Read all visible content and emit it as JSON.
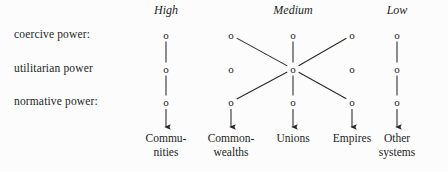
{
  "figure": {
    "background_color": "#fcfcfc",
    "ink_color": "#2a2724"
  },
  "column_headers": [
    {
      "label": "High",
      "x": 166
    },
    {
      "label": "Medium",
      "x": 293
    },
    {
      "label": "Low",
      "x": 397
    }
  ],
  "row_labels": [
    {
      "label": "coercive power:",
      "y": 35
    },
    {
      "label": "utilitarian power",
      "y": 69
    },
    {
      "label": "normative power:",
      "y": 102
    }
  ],
  "nodes": {
    "glyph": "o",
    "items": [
      {
        "id": "high-coercive",
        "x": 166,
        "y": 35,
        "column": "High",
        "row": "coercive power"
      },
      {
        "id": "high-utilitarian",
        "x": 166,
        "y": 69,
        "column": "High",
        "row": "utilitarian power"
      },
      {
        "id": "high-normative",
        "x": 166,
        "y": 102,
        "column": "High",
        "row": "normative power"
      },
      {
        "id": "med-left-coercive",
        "x": 231,
        "y": 35,
        "column": "Medium",
        "row": "coercive power"
      },
      {
        "id": "med-center-coercive",
        "x": 293,
        "y": 35,
        "column": "Medium",
        "row": "coercive power"
      },
      {
        "id": "med-right-coercive",
        "x": 352,
        "y": 35,
        "column": "Medium",
        "row": "coercive power"
      },
      {
        "id": "med-left-utilitarian",
        "x": 231,
        "y": 69,
        "column": "Medium",
        "row": "utilitarian power"
      },
      {
        "id": "med-hub-utilitarian",
        "x": 293,
        "y": 69,
        "column": "Medium",
        "row": "utilitarian power"
      },
      {
        "id": "med-right-utilitarian",
        "x": 352,
        "y": 69,
        "column": "Medium",
        "row": "utilitarian power"
      },
      {
        "id": "med-left-normative",
        "x": 231,
        "y": 102,
        "column": "Medium",
        "row": "normative power"
      },
      {
        "id": "med-center-normative",
        "x": 293,
        "y": 102,
        "column": "Medium",
        "row": "normative power"
      },
      {
        "id": "med-right-normative",
        "x": 352,
        "y": 102,
        "column": "Medium",
        "row": "normative power"
      },
      {
        "id": "low-coercive",
        "x": 397,
        "y": 35,
        "column": "Low",
        "row": "coercive power"
      },
      {
        "id": "low-utilitarian",
        "x": 397,
        "y": 69,
        "column": "Low",
        "row": "utilitarian power"
      },
      {
        "id": "low-normative",
        "x": 397,
        "y": 102,
        "column": "Low",
        "row": "normative power"
      }
    ]
  },
  "connectors": [
    {
      "from": "high-coercive",
      "to": "high-utilitarian",
      "kind": "line"
    },
    {
      "from": "high-utilitarian",
      "to": "high-normative",
      "kind": "line"
    },
    {
      "from": "med-center-coercive",
      "to": "med-hub-utilitarian",
      "kind": "line"
    },
    {
      "from": "med-hub-utilitarian",
      "to": "med-center-normative",
      "kind": "line"
    },
    {
      "from": "med-left-coercive",
      "to": "med-hub-utilitarian",
      "kind": "line"
    },
    {
      "from": "med-right-coercive",
      "to": "med-hub-utilitarian",
      "kind": "line"
    },
    {
      "from": "med-hub-utilitarian",
      "to": "med-left-normative",
      "kind": "line"
    },
    {
      "from": "med-hub-utilitarian",
      "to": "med-right-normative",
      "kind": "line"
    },
    {
      "from": "low-coercive",
      "to": "low-utilitarian",
      "kind": "line"
    },
    {
      "from": "low-utilitarian",
      "to": "low-normative",
      "kind": "line"
    }
  ],
  "arrows": [
    {
      "id": "arrow-communities",
      "x": 166,
      "y1": 109,
      "y2": 127
    },
    {
      "id": "arrow-commonwealths",
      "x": 231,
      "y1": 109,
      "y2": 127
    },
    {
      "id": "arrow-unions",
      "x": 293,
      "y1": 109,
      "y2": 127
    },
    {
      "id": "arrow-empires",
      "x": 352,
      "y1": 109,
      "y2": 127
    },
    {
      "id": "arrow-othersystems",
      "x": 397,
      "y1": 109,
      "y2": 127
    }
  ],
  "terms": [
    {
      "id": "term-communities",
      "line1": "Commu-",
      "line2": "nities",
      "x": 166
    },
    {
      "id": "term-commonwealths",
      "line1": "Common-",
      "line2": "wealths",
      "x": 231
    },
    {
      "id": "term-unions",
      "line1": "Unions",
      "line2": "",
      "x": 293
    },
    {
      "id": "term-empires",
      "line1": "Empires",
      "line2": "",
      "x": 352
    },
    {
      "id": "term-othersystems",
      "line1": "Other",
      "line2": "systems",
      "x": 397
    }
  ],
  "term_baseline_y": 132
}
